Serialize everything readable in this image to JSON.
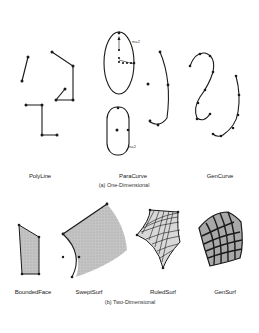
{
  "sections": {
    "one_dimensional": {
      "caption": "(a) One-Dimensional",
      "items": [
        {
          "label": "PolyLine"
        },
        {
          "label": "ParaCurve",
          "annotations": [
            "m=2",
            "m=2"
          ]
        },
        {
          "label": "GenCurve"
        }
      ]
    },
    "two_dimensional": {
      "caption": "(b) Two-Dimensional",
      "items": [
        {
          "label": "BoundedFace"
        },
        {
          "label": "SweptSurf"
        },
        {
          "label": "RuledSurf"
        },
        {
          "label": "GenSurf"
        }
      ]
    }
  },
  "colors": {
    "stroke": "#1a1a1a",
    "fill_surface": "#bdbdbd",
    "background": "#ffffff"
  }
}
